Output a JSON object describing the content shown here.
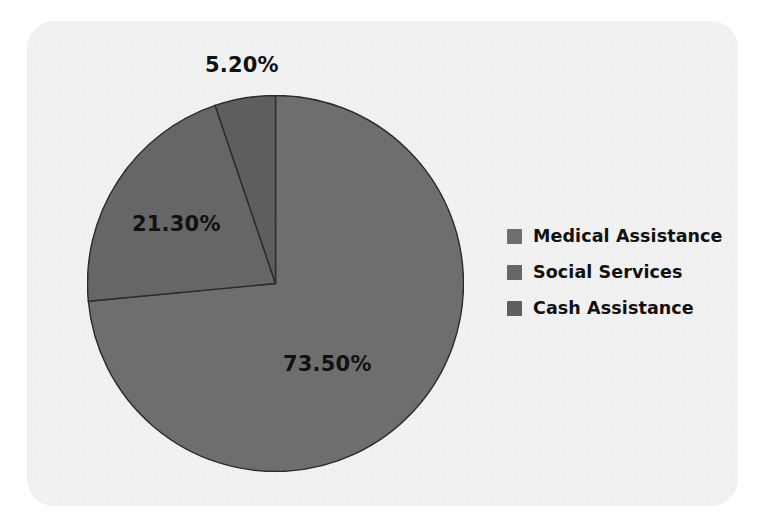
{
  "figure": {
    "background_color": "#ffffff",
    "plot_area_color": "#f2f2f2",
    "label_color": "#111111"
  },
  "legend": {
    "position": "right",
    "items": [
      {
        "label": "Medical Assistance",
        "swatch_color": "#6e6e6e",
        "swatch_name": "legend-swatch-medical-assistance"
      },
      {
        "label": "Social Services",
        "swatch_color": "#666666",
        "swatch_name": "legend-swatch-social-services"
      },
      {
        "label": "Cash Assistance",
        "swatch_color": "#5e5e5e",
        "swatch_name": "legend-swatch-cash-assistance"
      }
    ]
  },
  "labels": {
    "cash": "5.20%",
    "social": "21.30%",
    "medical": "73.50%"
  },
  "chart_data": {
    "type": "pie",
    "title": "",
    "subtitle": "",
    "xlabel": "",
    "ylabel": "",
    "grid": false,
    "legend_position": "right",
    "start_angle_deg": 0,
    "direction": "clockwise",
    "categories": [
      "Medical Assistance",
      "Social Services",
      "Cash Assistance"
    ],
    "values": [
      73.5,
      21.3,
      5.2
    ],
    "value_labels": [
      "73.50%",
      "21.30%",
      "5.20%"
    ],
    "units": "percent",
    "colors": [
      "#6e6e6e",
      "#666666",
      "#5e5e5e"
    ],
    "slice_border_color": "#2b2b2b",
    "slices": [
      {
        "name": "Medical Assistance",
        "value": 73.5,
        "label": "73.50%",
        "color": "#6e6e6e"
      },
      {
        "name": "Social Services",
        "value": 21.3,
        "label": "21.30%",
        "color": "#666666"
      },
      {
        "name": "Cash Assistance",
        "value": 5.2,
        "label": "5.20%",
        "color": "#5e5e5e"
      }
    ]
  }
}
